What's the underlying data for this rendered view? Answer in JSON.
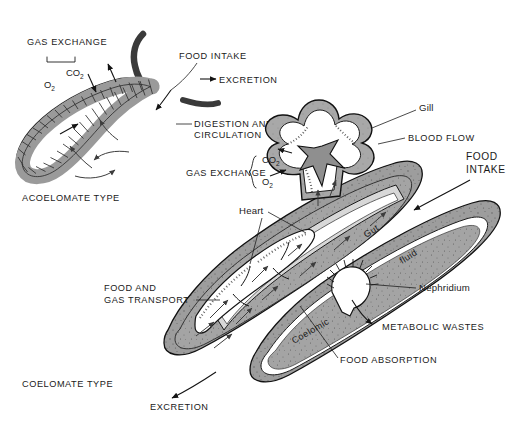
{
  "figure": {
    "background_color": "#ffffff",
    "ink_color": "#1a1a1a",
    "body_fill_color": "#9a9a9a",
    "body_fill_light": "#b0b0b0",
    "cavity_fill_color": "#ffffff"
  },
  "acoelomate": {
    "caption": "ACOELOMATE TYPE",
    "labels": {
      "gas_exchange": "GAS EXCHANGE",
      "co2": "CO",
      "co2_sub": "2",
      "o2": "O",
      "o2_sub": "2",
      "food_intake": "FOOD INTAKE",
      "excretion": "EXCRETION",
      "digestion_line1": "DIGESTION AND",
      "digestion_line2": "CIRCULATION"
    }
  },
  "coelomate": {
    "caption": "COELOMATE TYPE",
    "labels": {
      "gill": "Gill",
      "blood_flow": "BLOOD FLOW",
      "food_intake_line1": "FOOD",
      "food_intake_line2": "INTAKE",
      "gas_exchange": "GAS EXCHANGE",
      "co2": "CO",
      "co2_sub": "2",
      "o2": "O",
      "o2_sub": "2",
      "heart": "Heart",
      "gut": "Gut",
      "coelomic": "Coelomic",
      "fluid": "fluid",
      "nephridium": "Nephridium",
      "metabolic_wastes": "METABOLIC WASTES",
      "food_absorption": "FOOD ABSORPTION",
      "food_gas_transport_line1": "FOOD AND",
      "food_gas_transport_line2": "GAS TRANSPORT",
      "excretion": "EXCRETION"
    }
  }
}
